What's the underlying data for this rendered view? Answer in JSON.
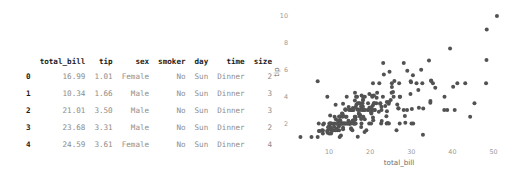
{
  "dataframe": {
    "index_header": "",
    "columns": [
      "total_bill",
      "tip",
      "sex",
      "smoker",
      "day",
      "time",
      "size"
    ],
    "rows": [
      {
        "index": "0",
        "total_bill": "16.99",
        "tip": "1.01",
        "sex": "Female",
        "smoker": "No",
        "day": "Sun",
        "time": "Dinner",
        "size": "2"
      },
      {
        "index": "1",
        "total_bill": "10.34",
        "tip": "1.66",
        "sex": "Male",
        "smoker": "No",
        "day": "Sun",
        "time": "Dinner",
        "size": "3"
      },
      {
        "index": "2",
        "total_bill": "21.01",
        "tip": "3.50",
        "sex": "Male",
        "smoker": "No",
        "day": "Sun",
        "time": "Dinner",
        "size": "3"
      },
      {
        "index": "3",
        "total_bill": "23.68",
        "tip": "3.31",
        "sex": "Male",
        "smoker": "No",
        "day": "Sun",
        "time": "Dinner",
        "size": "2"
      },
      {
        "index": "4",
        "total_bill": "24.59",
        "tip": "3.61",
        "sex": "Female",
        "smoker": "No",
        "day": "Sun",
        "time": "Dinner",
        "size": "4"
      }
    ]
  },
  "chart_data": {
    "type": "scatter",
    "title": "",
    "xlabel": "total_bill",
    "ylabel": "tip",
    "xlim": [
      1.5,
      53.5
    ],
    "ylim": [
      0.55,
      10.6
    ],
    "xticks": [
      10,
      20,
      30,
      40,
      50
    ],
    "yticks": [
      2,
      4,
      6,
      8,
      10
    ],
    "grid": false,
    "legend": "none",
    "marker_color": "#525252",
    "marker_size": 2.0,
    "points": [
      [
        16.99,
        1.01
      ],
      [
        10.34,
        1.66
      ],
      [
        21.01,
        3.5
      ],
      [
        23.68,
        3.31
      ],
      [
        24.59,
        3.61
      ],
      [
        25.29,
        4.71
      ],
      [
        8.77,
        2.0
      ],
      [
        26.88,
        3.12
      ],
      [
        15.04,
        1.96
      ],
      [
        14.78,
        3.23
      ],
      [
        10.27,
        1.71
      ],
      [
        35.26,
        5.0
      ],
      [
        15.42,
        1.57
      ],
      [
        18.43,
        3.0
      ],
      [
        14.83,
        3.02
      ],
      [
        21.58,
        3.92
      ],
      [
        10.33,
        1.67
      ],
      [
        16.29,
        3.71
      ],
      [
        16.97,
        3.5
      ],
      [
        20.65,
        3.35
      ],
      [
        17.92,
        4.08
      ],
      [
        20.29,
        2.75
      ],
      [
        15.77,
        2.23
      ],
      [
        39.42,
        7.58
      ],
      [
        19.82,
        3.18
      ],
      [
        17.81,
        2.34
      ],
      [
        13.37,
        2.0
      ],
      [
        12.69,
        2.0
      ],
      [
        21.7,
        4.3
      ],
      [
        19.65,
        3.0
      ],
      [
        9.55,
        1.45
      ],
      [
        18.35,
        2.5
      ],
      [
        15.06,
        3.0
      ],
      [
        20.69,
        2.45
      ],
      [
        17.78,
        3.27
      ],
      [
        24.06,
        3.6
      ],
      [
        16.31,
        2.0
      ],
      [
        16.93,
        3.07
      ],
      [
        18.69,
        2.31
      ],
      [
        31.27,
        5.0
      ],
      [
        16.04,
        2.24
      ],
      [
        17.46,
        2.54
      ],
      [
        13.94,
        3.06
      ],
      [
        9.68,
        1.32
      ],
      [
        30.4,
        5.6
      ],
      [
        18.29,
        3.0
      ],
      [
        22.23,
        5.0
      ],
      [
        32.4,
        6.0
      ],
      [
        28.55,
        2.05
      ],
      [
        18.04,
        3.0
      ],
      [
        12.54,
        2.5
      ],
      [
        10.29,
        2.6
      ],
      [
        34.81,
        5.2
      ],
      [
        9.94,
        1.56
      ],
      [
        25.56,
        4.34
      ],
      [
        19.49,
        3.51
      ],
      [
        38.01,
        3.0
      ],
      [
        26.41,
        1.5
      ],
      [
        11.24,
        1.76
      ],
      [
        48.27,
        6.73
      ],
      [
        20.29,
        3.21
      ],
      [
        13.81,
        2.0
      ],
      [
        11.02,
        1.98
      ],
      [
        18.29,
        3.76
      ],
      [
        17.59,
        2.64
      ],
      [
        20.08,
        3.15
      ],
      [
        16.45,
        2.47
      ],
      [
        3.07,
        1.0
      ],
      [
        20.23,
        2.01
      ],
      [
        15.01,
        2.09
      ],
      [
        12.02,
        1.97
      ],
      [
        17.07,
        3.0
      ],
      [
        26.86,
        3.14
      ],
      [
        25.28,
        5.0
      ],
      [
        14.73,
        2.2
      ],
      [
        10.51,
        1.25
      ],
      [
        17.92,
        3.08
      ],
      [
        27.2,
        4.0
      ],
      [
        22.76,
        3.0
      ],
      [
        17.29,
        2.71
      ],
      [
        19.44,
        3.0
      ],
      [
        16.66,
        3.4
      ],
      [
        10.07,
        1.83
      ],
      [
        32.68,
        5.0
      ],
      [
        15.98,
        2.03
      ],
      [
        34.83,
        5.17
      ],
      [
        13.03,
        2.0
      ],
      [
        18.28,
        4.0
      ],
      [
        24.71,
        5.85
      ],
      [
        21.16,
        3.0
      ],
      [
        28.97,
        3.0
      ],
      [
        22.49,
        3.5
      ],
      [
        5.75,
        1.0
      ],
      [
        16.32,
        4.3
      ],
      [
        22.75,
        3.25
      ],
      [
        40.17,
        4.73
      ],
      [
        27.28,
        4.0
      ],
      [
        12.03,
        1.5
      ],
      [
        21.01,
        3.0
      ],
      [
        12.46,
        1.5
      ],
      [
        11.35,
        2.5
      ],
      [
        15.38,
        3.0
      ],
      [
        44.3,
        2.5
      ],
      [
        22.42,
        3.48
      ],
      [
        20.92,
        4.08
      ],
      [
        15.36,
        1.64
      ],
      [
        20.49,
        4.06
      ],
      [
        25.21,
        4.29
      ],
      [
        18.24,
        3.76
      ],
      [
        14.31,
        4.0
      ],
      [
        14.0,
        3.0
      ],
      [
        7.25,
        1.0
      ],
      [
        38.07,
        4.0
      ],
      [
        23.95,
        2.55
      ],
      [
        25.71,
        4.0
      ],
      [
        17.31,
        3.5
      ],
      [
        29.93,
        5.07
      ],
      [
        10.65,
        1.5
      ],
      [
        12.43,
        1.8
      ],
      [
        24.08,
        2.92
      ],
      [
        11.69,
        2.31
      ],
      [
        13.42,
        1.68
      ],
      [
        14.26,
        2.5
      ],
      [
        15.95,
        2.0
      ],
      [
        12.48,
        2.52
      ],
      [
        29.8,
        4.2
      ],
      [
        8.52,
        1.48
      ],
      [
        14.52,
        2.0
      ],
      [
        11.38,
        2.0
      ],
      [
        22.82,
        2.18
      ],
      [
        19.08,
        1.5
      ],
      [
        20.27,
        2.83
      ],
      [
        11.17,
        1.5
      ],
      [
        12.26,
        2.0
      ],
      [
        18.26,
        3.25
      ],
      [
        8.51,
        1.25
      ],
      [
        10.33,
        2.0
      ],
      [
        14.15,
        2.0
      ],
      [
        16.0,
        2.0
      ],
      [
        13.16,
        2.75
      ],
      [
        17.47,
        3.5
      ],
      [
        34.3,
        6.7
      ],
      [
        41.19,
        5.0
      ],
      [
        27.05,
        5.0
      ],
      [
        16.43,
        2.3
      ],
      [
        8.35,
        1.5
      ],
      [
        18.64,
        1.36
      ],
      [
        11.87,
        1.63
      ],
      [
        9.78,
        1.73
      ],
      [
        7.51,
        2.0
      ],
      [
        14.07,
        2.5
      ],
      [
        13.13,
        2.0
      ],
      [
        17.26,
        2.74
      ],
      [
        24.55,
        2.0
      ],
      [
        19.77,
        2.0
      ],
      [
        29.85,
        5.14
      ],
      [
        48.17,
        5.0
      ],
      [
        25.0,
        3.75
      ],
      [
        13.39,
        2.61
      ],
      [
        16.49,
        2.0
      ],
      [
        21.5,
        3.5
      ],
      [
        12.66,
        2.5
      ],
      [
        16.21,
        2.0
      ],
      [
        13.81,
        2.0
      ],
      [
        17.51,
        3.0
      ],
      [
        24.52,
        3.48
      ],
      [
        20.76,
        2.24
      ],
      [
        31.71,
        4.5
      ],
      [
        10.59,
        1.61
      ],
      [
        10.63,
        2.0
      ],
      [
        50.81,
        10.0
      ],
      [
        15.81,
        3.16
      ],
      [
        7.25,
        5.15
      ],
      [
        31.85,
        3.18
      ],
      [
        16.82,
        4.0
      ],
      [
        32.9,
        3.11
      ],
      [
        17.89,
        2.0
      ],
      [
        14.48,
        2.0
      ],
      [
        9.6,
        4.0
      ],
      [
        34.63,
        3.55
      ],
      [
        34.65,
        3.68
      ],
      [
        23.33,
        5.65
      ],
      [
        45.35,
        3.5
      ],
      [
        23.17,
        6.5
      ],
      [
        40.55,
        3.0
      ],
      [
        20.69,
        5.0
      ],
      [
        20.9,
        3.5
      ],
      [
        30.46,
        2.0
      ],
      [
        18.15,
        3.5
      ],
      [
        23.1,
        4.0
      ],
      [
        15.69,
        1.5
      ],
      [
        19.81,
        4.19
      ],
      [
        28.44,
        2.56
      ],
      [
        15.48,
        2.02
      ],
      [
        16.58,
        4.0
      ],
      [
        7.56,
        1.44
      ],
      [
        10.34,
        2.0
      ],
      [
        43.11,
        5.0
      ],
      [
        13.0,
        2.0
      ],
      [
        13.51,
        2.0
      ],
      [
        18.71,
        4.0
      ],
      [
        12.74,
        2.01
      ],
      [
        13.0,
        2.0
      ],
      [
        16.4,
        2.5
      ],
      [
        20.53,
        4.0
      ],
      [
        16.47,
        3.23
      ],
      [
        26.59,
        3.41
      ],
      [
        38.73,
        3.0
      ],
      [
        24.27,
        2.03
      ],
      [
        12.76,
        2.23
      ],
      [
        30.06,
        2.0
      ],
      [
        25.89,
        5.16
      ],
      [
        48.33,
        9.0
      ],
      [
        13.27,
        2.5
      ],
      [
        28.17,
        6.5
      ],
      [
        12.9,
        1.1
      ],
      [
        28.15,
        3.0
      ],
      [
        11.59,
        1.5
      ],
      [
        7.74,
        1.44
      ],
      [
        30.14,
        3.09
      ],
      [
        12.16,
        2.2
      ],
      [
        13.42,
        3.48
      ],
      [
        8.58,
        1.92
      ],
      [
        15.98,
        3.0
      ],
      [
        13.42,
        1.58
      ],
      [
        16.27,
        2.5
      ],
      [
        10.09,
        2.0
      ],
      [
        20.45,
        3.0
      ],
      [
        13.28,
        2.72
      ],
      [
        22.12,
        2.88
      ],
      [
        24.01,
        2.0
      ],
      [
        15.69,
        3.0
      ],
      [
        11.61,
        3.39
      ],
      [
        10.77,
        1.47
      ],
      [
        15.53,
        3.0
      ],
      [
        10.07,
        1.25
      ],
      [
        12.6,
        1.0
      ],
      [
        32.83,
        1.17
      ],
      [
        35.83,
        4.67
      ],
      [
        29.03,
        5.92
      ],
      [
        27.18,
        2.0
      ],
      [
        22.67,
        2.0
      ],
      [
        17.82,
        1.75
      ],
      [
        18.78,
        3.0
      ]
    ]
  }
}
